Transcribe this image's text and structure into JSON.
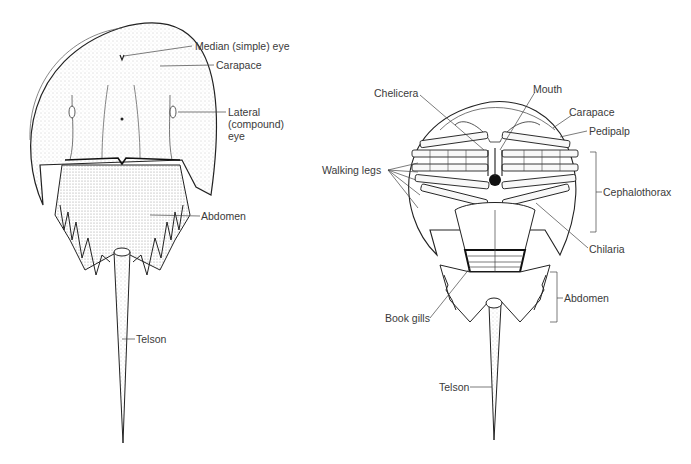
{
  "figure": {
    "dorsal_view": {
      "labels": {
        "median_eye": "Median (simple) eye",
        "carapace": "Carapace",
        "lateral_eye_1": "Lateral",
        "lateral_eye_2": "(compound)",
        "lateral_eye_3": "eye",
        "abdomen": "Abdomen",
        "telson": "Telson"
      }
    },
    "ventral_view": {
      "labels": {
        "chelicera": "Chelicera",
        "mouth": "Mouth",
        "carapace": "Carapace",
        "pedipalp": "Pedipalp",
        "walking_legs": "Walking legs",
        "cephalothorax": "Cephalothorax",
        "chilaria": "Chilaria",
        "abdomen": "Abdomen",
        "book_gills": "Book gills",
        "telson": "Telson"
      }
    }
  }
}
